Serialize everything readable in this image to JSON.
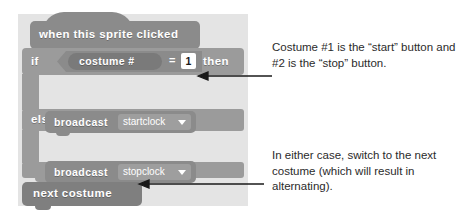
{
  "script": {
    "hat_block": {
      "label": "when this sprite clicked"
    },
    "if_block": {
      "if_label": "if",
      "then_label": "then",
      "else_label": "else",
      "condition": {
        "reporter_label": "costume #",
        "operator": "=",
        "value": "1"
      }
    },
    "broadcast_if": {
      "label": "broadcast",
      "message": "startclock"
    },
    "broadcast_else": {
      "label": "broadcast",
      "message": "stopclock"
    },
    "next_costume_block": {
      "label": "next costume"
    }
  },
  "annotations": {
    "top": "Costume #1 is the “start” button and #2 is the “stop” button.",
    "bottom": "In either case, switch to the next costume (which will result in alternating)."
  },
  "colors": {
    "panel_background": "#e4e4e4",
    "hat_block": "#8b8b8b",
    "control_block": "#9b9b9b",
    "operator_block": "#8b8b8b",
    "reporter_block": "#7a7a7a",
    "looks_block": "#7f7f7f",
    "input_field": "#ffffff",
    "block_text": "#ffffff",
    "annotation_text": "#2b2b2b",
    "arrow": "#1a1a1a"
  }
}
